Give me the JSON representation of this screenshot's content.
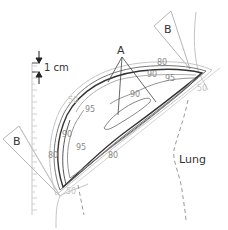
{
  "diagram": {
    "labels": {
      "hotspot": "A",
      "beam_medial": "B",
      "beam_lateral": "B",
      "organ": "Lung",
      "scale": "1 cm"
    },
    "isodose_labels": [
      {
        "id": "iso-50-top",
        "text": "50",
        "x": 68,
        "y": 92,
        "light": true
      },
      {
        "id": "iso-95-top",
        "text": "95",
        "x": 85,
        "y": 111,
        "light": false
      },
      {
        "id": "iso-80-top",
        "text": "80",
        "x": 158,
        "y": 65,
        "light": false
      },
      {
        "id": "iso-90-top",
        "text": "90",
        "x": 145,
        "y": 77,
        "light": false
      },
      {
        "id": "iso-95-right",
        "text": "95",
        "x": 164,
        "y": 81,
        "light": false
      },
      {
        "id": "iso-90-inner",
        "text": "90",
        "x": 130,
        "y": 97,
        "light": false
      },
      {
        "id": "iso-50-right",
        "text": "50",
        "x": 196,
        "y": 92,
        "light": true
      },
      {
        "id": "iso-90-left",
        "text": "90",
        "x": 62,
        "y": 137,
        "light": false
      },
      {
        "id": "iso-95-left",
        "text": "95",
        "x": 76,
        "y": 150,
        "light": false
      },
      {
        "id": "iso-80-left",
        "text": "80",
        "x": 48,
        "y": 157,
        "light": false
      },
      {
        "id": "iso-80-bottom",
        "text": "80",
        "x": 108,
        "y": 158,
        "light": false
      },
      {
        "id": "iso-50-bottom",
        "text": "50",
        "x": 67,
        "y": 194,
        "light": true
      }
    ],
    "colors": {
      "line_dark": "#333333",
      "line_mid": "#777777",
      "line_light": "#bdbdbd",
      "text_iso": "#8a8a8a",
      "text_light": "#c2c2c2"
    }
  }
}
